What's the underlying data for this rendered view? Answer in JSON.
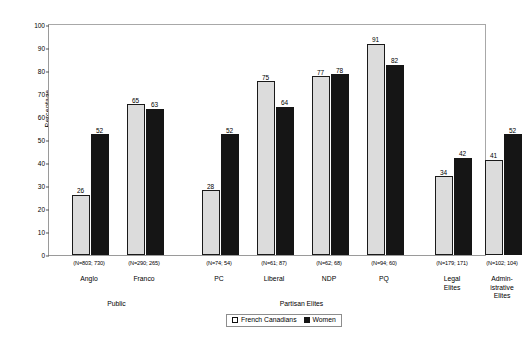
{
  "chart_data": {
    "type": "bar",
    "title": "",
    "xlabel": "",
    "ylabel": "Percentage",
    "ylim": [
      0,
      100
    ],
    "yticks": [
      0,
      10,
      20,
      30,
      40,
      50,
      60,
      70,
      80,
      90,
      100
    ],
    "grid": false,
    "legend_position": "bottom-center",
    "categories": [
      "Anglo",
      "Franco",
      "PC",
      "Liberal",
      "NDP",
      "PQ",
      "Legal Elites",
      "Admin-istrative Elites"
    ],
    "group_labels": [
      "Public",
      "Partisan Elites",
      ""
    ],
    "n_labels": [
      "(N=803; 730)",
      "(N=290; 265)",
      "(N=74; 54)",
      "(N=61; 87)",
      "(N=62; 68)",
      "(N=94; 60)",
      "(N=179; 171)",
      "(N=102; 104)"
    ],
    "series": [
      {
        "name": "French Canadians",
        "color": "#dcdcdc",
        "values": [
          26,
          65,
          28,
          75,
          77,
          91,
          34,
          41
        ]
      },
      {
        "name": "Women",
        "color": "#151515",
        "values": [
          52,
          63,
          52,
          64,
          78,
          82,
          42,
          52
        ]
      }
    ]
  },
  "legend": {
    "items": [
      {
        "label": "French Canadians"
      },
      {
        "label": "Women"
      }
    ]
  },
  "categories_display": [
    {
      "line1": "Anglo",
      "line2": ""
    },
    {
      "line1": "Franco",
      "line2": ""
    },
    {
      "line1": "PC",
      "line2": ""
    },
    {
      "line1": "Liberal",
      "line2": ""
    },
    {
      "line1": "NDP",
      "line2": ""
    },
    {
      "line1": "PQ",
      "line2": ""
    },
    {
      "line1": "Legal",
      "line2": "Elites"
    },
    {
      "line1": "Admin-",
      "line2": "istrative",
      "line3": "Elites"
    }
  ],
  "supergroups": [
    {
      "label": "Public"
    },
    {
      "label": "Partisan Elites"
    }
  ]
}
